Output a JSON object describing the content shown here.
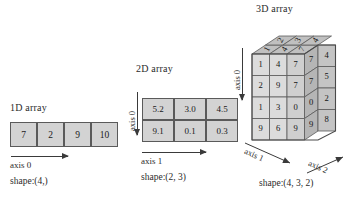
{
  "figure": {
    "background": "#ffffff",
    "cell_fill": "#d3d3d3",
    "cell_stroke": "#5a5a5a",
    "top_face_fill": "#c0c0c0",
    "side_face_fill": "#a9a9a9",
    "front_face_fill": "#dcdcdc"
  },
  "array1d": {
    "title": "1D array",
    "values": [
      "7",
      "2",
      "9",
      "10"
    ],
    "axis_label": "axis 0",
    "shape_label": "shape:(4,)"
  },
  "array2d": {
    "title": "2D array",
    "rows": [
      [
        "5.2",
        "3.0",
        "4.5"
      ],
      [
        "9.1",
        "0.1",
        "0.3"
      ]
    ],
    "axis0_label": "axis 0",
    "axis1_label": "axis 1",
    "shape_label": "shape:(2, 3)"
  },
  "array3d": {
    "title": "3D array",
    "axis0_label": "axis 0",
    "axis1_label": "axis 1",
    "axis2_label": "axis 2",
    "shape_label": "shape:(4, 3, 2)",
    "top_face": [
      [
        "1",
        "2"
      ],
      [
        "4",
        "3"
      ],
      [
        "7",
        "4"
      ]
    ],
    "front_face": [
      [
        "1",
        "4",
        "7"
      ],
      [
        "2",
        "9",
        "7"
      ],
      [
        "1",
        "3",
        "0"
      ],
      [
        "9",
        "6",
        "9"
      ]
    ],
    "right_face": [
      "4",
      "5",
      "2",
      "8"
    ],
    "front_right_column": [
      "7",
      "7",
      "0",
      "9"
    ]
  }
}
